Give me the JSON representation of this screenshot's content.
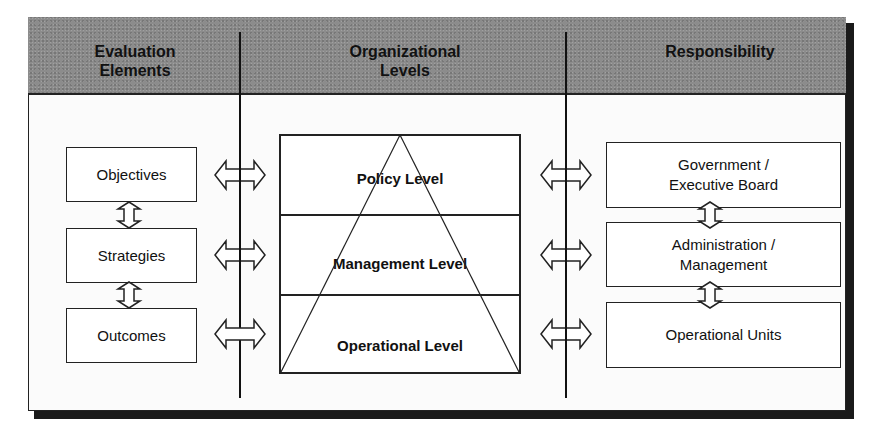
{
  "diagram": {
    "type": "organizational-evaluation-framework",
    "columns": [
      {
        "id": "evaluation",
        "header": "Evaluation Elements",
        "header_lines": [
          "Evaluation",
          "Elements"
        ]
      },
      {
        "id": "levels",
        "header": "Organizational Levels",
        "header_lines": [
          "Organizational",
          "Levels"
        ]
      },
      {
        "id": "responsibility",
        "header": "Responsibility",
        "header_lines": [
          "Responsibility"
        ]
      }
    ],
    "evaluation_elements": [
      {
        "label": "Objectives"
      },
      {
        "label": "Strategies"
      },
      {
        "label": "Outcomes"
      }
    ],
    "organizational_levels": [
      {
        "label": "Policy Level"
      },
      {
        "label": "Management Level"
      },
      {
        "label": "Operational Level"
      }
    ],
    "responsibility": [
      {
        "lines": [
          "Government /",
          "Executive Board"
        ]
      },
      {
        "lines": [
          "Administration /",
          "Management"
        ]
      },
      {
        "lines": [
          "Operational Units"
        ]
      }
    ],
    "connectors": {
      "vertical_between_elements": 2,
      "vertical_between_responsibilities": 2,
      "horizontal_left": 3,
      "horizontal_right": 3,
      "style": "double-headed-hollow-arrow"
    },
    "colors": {
      "header_bg": "#8c8c8c",
      "line": "#222222",
      "shadow": "#1a1a1a",
      "box_bg": "#ffffff"
    }
  }
}
